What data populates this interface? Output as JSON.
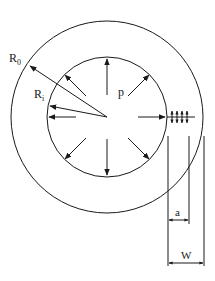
{
  "diagram": {
    "labels": {
      "outer_radius": "R",
      "outer_radius_sub": "0",
      "inner_radius": "R",
      "inner_radius_sub": "i",
      "pressure": "p",
      "crack_length": "a",
      "wall_thickness": "W"
    },
    "colors": {
      "line": "#1a1a1a",
      "background": "#ffffff"
    }
  }
}
